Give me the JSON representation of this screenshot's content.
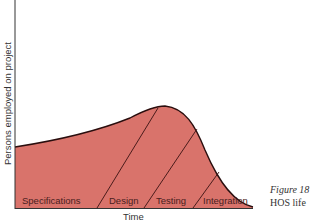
{
  "diagram": {
    "y_axis_label": "Persons employed on project",
    "x_axis_label": "Time",
    "phases": [
      "Specifications",
      "Design",
      "Testing",
      "Integration"
    ],
    "fill_color": "#d9736b",
    "line_color": "#3a1212"
  },
  "caption": {
    "line1": "Figure 18",
    "line2": "HOS life"
  }
}
